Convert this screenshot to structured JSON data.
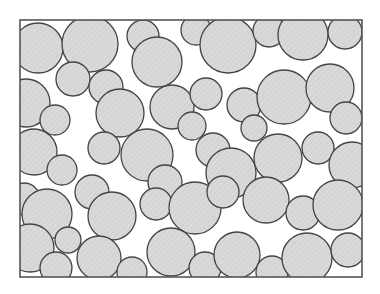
{
  "figure": {
    "type": "schematic-illustration",
    "canvas": {
      "width": 380,
      "height": 294,
      "background": "#ffffff"
    },
    "frame": {
      "x": 20,
      "y": 20,
      "width": 342,
      "height": 257,
      "stroke": "#555555",
      "stroke_width": 1.6,
      "fill": "#ffffff"
    },
    "style": {
      "circle_fill": "#d9d9d9",
      "circle_stroke": "#444444",
      "circle_stroke_width": 1.3,
      "hatch_stroke": "#c8c8c8",
      "hatch_opacity": 0.55
    },
    "legend": {
      "large_label": "large particle",
      "small_label": "small particle"
    },
    "counts": {
      "large_circles": 29,
      "small_circles": 24,
      "total": 53
    },
    "circles": [
      {
        "cx": 38,
        "cy": 48,
        "r": 25,
        "cls": "large"
      },
      {
        "cx": 90,
        "cy": 44,
        "r": 28,
        "cls": "large"
      },
      {
        "cx": 73,
        "cy": 79,
        "r": 17,
        "cls": "small"
      },
      {
        "cx": 143,
        "cy": 36,
        "r": 16,
        "cls": "small"
      },
      {
        "cx": 157,
        "cy": 62,
        "r": 25,
        "cls": "large"
      },
      {
        "cx": 196,
        "cy": 30,
        "r": 15,
        "cls": "small"
      },
      {
        "cx": 228,
        "cy": 45,
        "r": 28,
        "cls": "large"
      },
      {
        "cx": 269,
        "cy": 31,
        "r": 16,
        "cls": "small"
      },
      {
        "cx": 303,
        "cy": 35,
        "r": 25,
        "cls": "large"
      },
      {
        "cx": 345,
        "cy": 32,
        "r": 17,
        "cls": "small"
      },
      {
        "cx": 26,
        "cy": 103,
        "r": 24,
        "cls": "large"
      },
      {
        "cx": 55,
        "cy": 120,
        "r": 15,
        "cls": "small"
      },
      {
        "cx": 106,
        "cy": 87,
        "r": 17,
        "cls": "small"
      },
      {
        "cx": 120,
        "cy": 113,
        "r": 24,
        "cls": "large"
      },
      {
        "cx": 172,
        "cy": 107,
        "r": 22,
        "cls": "large"
      },
      {
        "cx": 206,
        "cy": 94,
        "r": 16,
        "cls": "small"
      },
      {
        "cx": 244,
        "cy": 105,
        "r": 17,
        "cls": "small"
      },
      {
        "cx": 284,
        "cy": 97,
        "r": 27,
        "cls": "large"
      },
      {
        "cx": 330,
        "cy": 88,
        "r": 24,
        "cls": "large"
      },
      {
        "cx": 346,
        "cy": 118,
        "r": 16,
        "cls": "small"
      },
      {
        "cx": 34,
        "cy": 152,
        "r": 23,
        "cls": "large"
      },
      {
        "cx": 62,
        "cy": 170,
        "r": 15,
        "cls": "small"
      },
      {
        "cx": 104,
        "cy": 148,
        "r": 16,
        "cls": "small"
      },
      {
        "cx": 147,
        "cy": 155,
        "r": 26,
        "cls": "large"
      },
      {
        "cx": 165,
        "cy": 182,
        "r": 17,
        "cls": "small"
      },
      {
        "cx": 213,
        "cy": 150,
        "r": 17,
        "cls": "small"
      },
      {
        "cx": 231,
        "cy": 173,
        "r": 25,
        "cls": "large"
      },
      {
        "cx": 278,
        "cy": 158,
        "r": 24,
        "cls": "large"
      },
      {
        "cx": 318,
        "cy": 148,
        "r": 16,
        "cls": "small"
      },
      {
        "cx": 352,
        "cy": 165,
        "r": 23,
        "cls": "large"
      },
      {
        "cx": 24,
        "cy": 199,
        "r": 16,
        "cls": "small"
      },
      {
        "cx": 47,
        "cy": 214,
        "r": 25,
        "cls": "large"
      },
      {
        "cx": 92,
        "cy": 192,
        "r": 17,
        "cls": "small"
      },
      {
        "cx": 112,
        "cy": 216,
        "r": 24,
        "cls": "large"
      },
      {
        "cx": 156,
        "cy": 204,
        "r": 16,
        "cls": "small"
      },
      {
        "cx": 195,
        "cy": 208,
        "r": 26,
        "cls": "large"
      },
      {
        "cx": 223,
        "cy": 192,
        "r": 16,
        "cls": "small"
      },
      {
        "cx": 266,
        "cy": 200,
        "r": 23,
        "cls": "large"
      },
      {
        "cx": 303,
        "cy": 213,
        "r": 17,
        "cls": "small"
      },
      {
        "cx": 338,
        "cy": 205,
        "r": 25,
        "cls": "large"
      },
      {
        "cx": 30,
        "cy": 248,
        "r": 24,
        "cls": "large"
      },
      {
        "cx": 56,
        "cy": 268,
        "r": 16,
        "cls": "small"
      },
      {
        "cx": 99,
        "cy": 258,
        "r": 22,
        "cls": "large"
      },
      {
        "cx": 132,
        "cy": 272,
        "r": 15,
        "cls": "small"
      },
      {
        "cx": 171,
        "cy": 252,
        "r": 24,
        "cls": "large"
      },
      {
        "cx": 205,
        "cy": 268,
        "r": 16,
        "cls": "small"
      },
      {
        "cx": 237,
        "cy": 255,
        "r": 23,
        "cls": "large"
      },
      {
        "cx": 272,
        "cy": 272,
        "r": 16,
        "cls": "small"
      },
      {
        "cx": 307,
        "cy": 258,
        "r": 25,
        "cls": "large"
      },
      {
        "cx": 348,
        "cy": 250,
        "r": 17,
        "cls": "small"
      },
      {
        "cx": 192,
        "cy": 126,
        "r": 14,
        "cls": "small"
      },
      {
        "cx": 68,
        "cy": 240,
        "r": 13,
        "cls": "small"
      },
      {
        "cx": 254,
        "cy": 128,
        "r": 13,
        "cls": "small"
      }
    ]
  }
}
